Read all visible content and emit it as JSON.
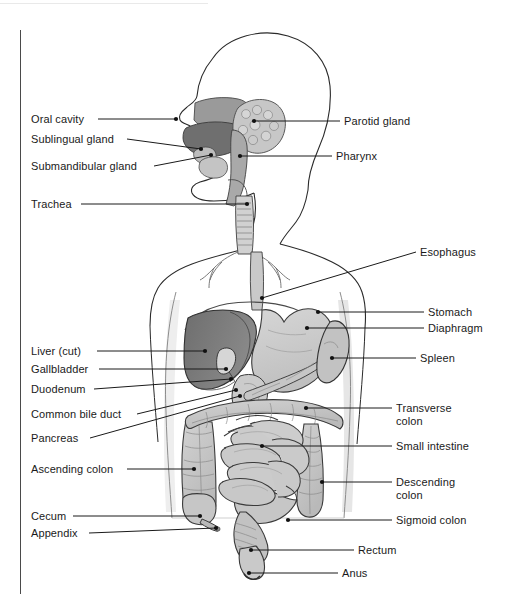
{
  "figure": {
    "background_color": "#ffffff",
    "frame_color": "#4a4a4a",
    "outline_color": "#1a1a1a",
    "leader_line_color": "#1a1a1a"
  },
  "palette": {
    "body_outline": "#1a1a1a",
    "body_shadow": "#e2e2e2",
    "liver": "#7b7b7b",
    "liver_dark": "#6a6a6a",
    "stomach": "#cfcfcf",
    "spleen": "#c4c4c4",
    "pancreas": "#bdbdbd",
    "intestine": "#c9c9c9",
    "colon": "#c2c2c2",
    "gland": "#b9b9b9",
    "trachea": "#cccccc",
    "tongue": "#8e8e8e",
    "palate": "#9a9a9a"
  },
  "labels_left": [
    {
      "id": "oral-cavity",
      "text": "Oral cavity",
      "x": 31,
      "y": 113,
      "line": {
        "x1": 98,
        "y1": 119,
        "x2": 176,
        "y2": 119
      }
    },
    {
      "id": "sublingual-gland",
      "text": "Sublingual gland",
      "x": 31,
      "y": 133,
      "line": {
        "x1": 127,
        "y1": 139,
        "x2": 201,
        "y2": 149
      }
    },
    {
      "id": "submandibular-gland",
      "text": "Submandibular gland",
      "x": 31,
      "y": 160,
      "line": {
        "x1": 154,
        "y1": 166,
        "x2": 211,
        "y2": 155
      }
    },
    {
      "id": "trachea",
      "text": "Trachea",
      "x": 31,
      "y": 198,
      "line": {
        "x1": 81,
        "y1": 204,
        "x2": 247,
        "y2": 204
      }
    },
    {
      "id": "liver-cut",
      "text": "Liver (cut)",
      "x": 31,
      "y": 345,
      "line": {
        "x1": 97,
        "y1": 351,
        "x2": 205,
        "y2": 351
      }
    },
    {
      "id": "gallbladder",
      "text": "Gallbladder",
      "x": 31,
      "y": 363,
      "line": {
        "x1": 99,
        "y1": 369,
        "x2": 226,
        "y2": 369
      }
    },
    {
      "id": "duodenum",
      "text": "Duodenum",
      "x": 31,
      "y": 383,
      "line": {
        "x1": 94,
        "y1": 389,
        "x2": 231,
        "y2": 379
      }
    },
    {
      "id": "common-bile-duct",
      "text": "Common bile duct",
      "x": 31,
      "y": 408,
      "line": {
        "x1": 137,
        "y1": 414,
        "x2": 236,
        "y2": 390
      }
    },
    {
      "id": "pancreas",
      "text": "Pancreas",
      "x": 31,
      "y": 432,
      "line": {
        "x1": 90,
        "y1": 438,
        "x2": 240,
        "y2": 396
      }
    },
    {
      "id": "ascending-colon",
      "text": "Ascending colon",
      "x": 31,
      "y": 463,
      "line": {
        "x1": 127,
        "y1": 469,
        "x2": 194,
        "y2": 469
      }
    },
    {
      "id": "cecum",
      "text": "Cecum",
      "x": 31,
      "y": 510,
      "line": {
        "x1": 73,
        "y1": 516,
        "x2": 200,
        "y2": 516
      }
    },
    {
      "id": "appendix",
      "text": "Appendix",
      "x": 31,
      "y": 527,
      "line": {
        "x1": 89,
        "y1": 533,
        "x2": 216,
        "y2": 528
      }
    }
  ],
  "labels_right": [
    {
      "id": "parotid-gland",
      "text": "Parotid gland",
      "x": 344,
      "y": 115,
      "line": {
        "x1": 254,
        "y1": 121,
        "x2": 340,
        "y2": 121
      }
    },
    {
      "id": "pharynx",
      "text": "Pharynx",
      "x": 336,
      "y": 150,
      "line": {
        "x1": 240,
        "y1": 156,
        "x2": 332,
        "y2": 156
      }
    },
    {
      "id": "esophagus",
      "text": "Esophagus",
      "x": 420,
      "y": 246,
      "line": {
        "x1": 262,
        "y1": 298,
        "x2": 416,
        "y2": 252
      }
    },
    {
      "id": "stomach",
      "text": "Stomach",
      "x": 428,
      "y": 306,
      "line": {
        "x1": 318,
        "y1": 312,
        "x2": 424,
        "y2": 312
      }
    },
    {
      "id": "diaphragm",
      "text": "Diaphragm",
      "x": 428,
      "y": 322,
      "line": {
        "x1": 307,
        "y1": 328,
        "x2": 424,
        "y2": 328
      }
    },
    {
      "id": "spleen",
      "text": "Spleen",
      "x": 420,
      "y": 352,
      "line": {
        "x1": 332,
        "y1": 358,
        "x2": 416,
        "y2": 358
      }
    },
    {
      "id": "transverse-colon",
      "text": "Transverse\ncolon",
      "x": 396,
      "y": 402,
      "line": {
        "x1": 306,
        "y1": 408,
        "x2": 392,
        "y2": 408
      }
    },
    {
      "id": "small-intestine",
      "text": "Small intestine",
      "x": 396,
      "y": 440,
      "line": {
        "x1": 262,
        "y1": 446,
        "x2": 392,
        "y2": 446
      }
    },
    {
      "id": "descending-colon",
      "text": "Descending\ncolon",
      "x": 396,
      "y": 476,
      "line": {
        "x1": 322,
        "y1": 482,
        "x2": 392,
        "y2": 482
      }
    },
    {
      "id": "sigmoid-colon",
      "text": "Sigmoid colon",
      "x": 396,
      "y": 514,
      "line": {
        "x1": 288,
        "y1": 520,
        "x2": 392,
        "y2": 520
      }
    },
    {
      "id": "rectum",
      "text": "Rectum",
      "x": 358,
      "y": 544,
      "line": {
        "x1": 251,
        "y1": 550,
        "x2": 354,
        "y2": 550
      }
    },
    {
      "id": "anus",
      "text": "Anus",
      "x": 342,
      "y": 567,
      "line": {
        "x1": 249,
        "y1": 573,
        "x2": 338,
        "y2": 573
      }
    }
  ],
  "dots": [
    {
      "id": "dot-parotid",
      "x": 254,
      "y": 121
    },
    {
      "id": "dot-pharynx",
      "x": 240,
      "y": 156
    },
    {
      "id": "dot-oral-cavity",
      "x": 176,
      "y": 119
    },
    {
      "id": "dot-sublingual",
      "x": 201,
      "y": 149
    },
    {
      "id": "dot-submandibular",
      "x": 211,
      "y": 155
    },
    {
      "id": "dot-trachea",
      "x": 247,
      "y": 204
    },
    {
      "id": "dot-esophagus",
      "x": 262,
      "y": 298
    },
    {
      "id": "dot-stomach",
      "x": 318,
      "y": 312
    },
    {
      "id": "dot-diaphragm",
      "x": 307,
      "y": 328
    },
    {
      "id": "dot-spleen",
      "x": 332,
      "y": 358
    },
    {
      "id": "dot-liver",
      "x": 205,
      "y": 351
    },
    {
      "id": "dot-gallbladder",
      "x": 226,
      "y": 369
    },
    {
      "id": "dot-duodenum",
      "x": 231,
      "y": 379
    },
    {
      "id": "dot-bile-duct",
      "x": 236,
      "y": 390
    },
    {
      "id": "dot-pancreas",
      "x": 240,
      "y": 396
    },
    {
      "id": "dot-transverse",
      "x": 306,
      "y": 408
    },
    {
      "id": "dot-small-intestine",
      "x": 262,
      "y": 446
    },
    {
      "id": "dot-ascending",
      "x": 194,
      "y": 469
    },
    {
      "id": "dot-descending",
      "x": 322,
      "y": 482
    },
    {
      "id": "dot-cecum",
      "x": 200,
      "y": 516
    },
    {
      "id": "dot-appendix",
      "x": 216,
      "y": 528
    },
    {
      "id": "dot-sigmoid",
      "x": 288,
      "y": 520
    },
    {
      "id": "dot-rectum",
      "x": 251,
      "y": 550
    },
    {
      "id": "dot-anus",
      "x": 249,
      "y": 573
    }
  ]
}
